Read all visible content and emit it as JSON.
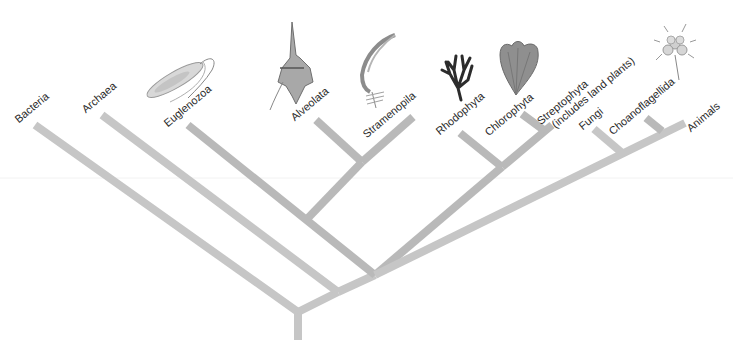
{
  "diagram": {
    "type": "phylogenetic-tree",
    "colors": {
      "branch": "#c6c6c6",
      "branch_dark": "#b9b9b9",
      "text": "#2a2a2a"
    },
    "taxa": [
      {
        "id": "bacteria",
        "label": "Bacteria"
      },
      {
        "id": "archaea",
        "label": "Archaea"
      },
      {
        "id": "euglenozoa",
        "label": "Euglenozoa",
        "illustration": "euglena"
      },
      {
        "id": "alveolata",
        "label": "Alveolata",
        "illustration": "dinoflagellate"
      },
      {
        "id": "stramenopila",
        "label": "Stramenopila",
        "illustration": "brown-alga"
      },
      {
        "id": "rhodophyta",
        "label": "Rhodophyta",
        "illustration": "red-alga"
      },
      {
        "id": "chlorophyta",
        "label": "Chlorophyta",
        "illustration": "green-alga"
      },
      {
        "id": "streptophyta",
        "label": "Streptophyta",
        "label_line2": "(includes land plants)"
      },
      {
        "id": "fungi",
        "label": "Fungi"
      },
      {
        "id": "choanoflagellida",
        "label": "Choanoflagellida",
        "illustration": "choanoflagellate-colony"
      },
      {
        "id": "animals",
        "label": "Animals"
      }
    ]
  }
}
